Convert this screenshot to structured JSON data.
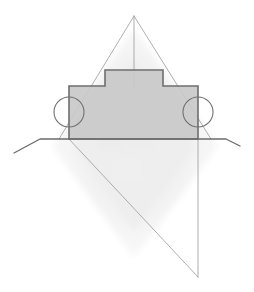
{
  "figure": {
    "title": "Geometric line drawing of a wheeled block on a ground line with construction lines",
    "canvas": {
      "width": 254,
      "height": 292,
      "background": "#ffffff"
    },
    "colors": {
      "body_fill": "#c9c9c9",
      "body_stroke": "#6e6e6e",
      "ground_stroke": "#6b6b6b",
      "construction_stroke": "#9a9a9a",
      "watermark_fill": "#f0f0f0",
      "wheel_stroke": "#707070",
      "wheel_fill": "none"
    },
    "strokes": {
      "body_width": 1.6,
      "ground_width": 1.3,
      "construction_width": 0.8,
      "wheel_width": 1.1
    },
    "shapes": {
      "body": {
        "name": "wheeled-block-body",
        "points": "69,86 105,86 105,70 163,70 163,86 198,86 198,139 69,139",
        "fill": "#c9c9c9",
        "stroke": "#6e6e6e"
      },
      "hump": {
        "name": "block-top-hump",
        "left_x": 105,
        "right_x": 163,
        "top_y": 70,
        "base_y": 86
      },
      "wheel_left": {
        "name": "wheel-left",
        "cx": 69,
        "cy": 112,
        "r": 15
      },
      "wheel_right": {
        "name": "wheel-right",
        "cx": 198,
        "cy": 112,
        "r": 15
      },
      "ground_line": {
        "name": "ground-line",
        "points": "14,153 40,139 226,139 240,146",
        "stroke": "#6b6b6b"
      },
      "construction": {
        "apex": {
          "x": 134,
          "y": 16
        },
        "bottom_vertex": {
          "x": 198,
          "y": 277
        },
        "left_diagonal_up": "59,139 134,16",
        "right_diagonal_up": "134,16 211,139",
        "center_vertical": "134,16 134,86",
        "left_diagonal_down": "69,139 198,277",
        "right_vertical_down": "198,139 198,277"
      },
      "watermark": {
        "name": "background-watermark-diamond",
        "points": "134,30 215,145 134,255 54,145",
        "fill": "#f1f1f1"
      }
    }
  }
}
